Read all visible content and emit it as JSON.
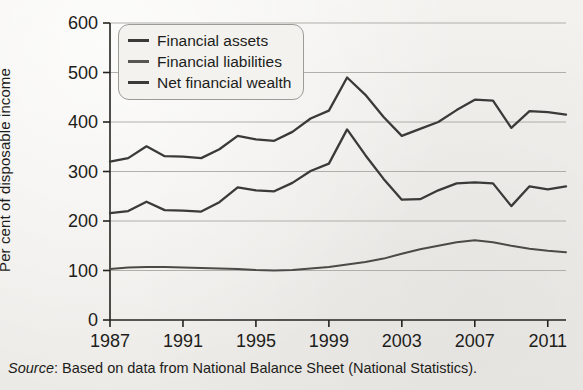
{
  "figure": {
    "y_axis_label": "Per cent of disposable income",
    "source_prefix": "Source",
    "source_text": ": Based on data from National Balance Sheet (National Statistics)."
  },
  "legend": {
    "items": [
      {
        "label": "Financial assets",
        "swatch": "line-swatch-dark"
      },
      {
        "label": "Financial liabilities",
        "swatch": "line-swatch-mid"
      },
      {
        "label": "Net financial wealth",
        "swatch": "line-swatch-dark"
      }
    ]
  },
  "colors": {
    "background": "#f2f1ee",
    "axis": "#24241f",
    "grid": "#a9a7a2",
    "series": "#3a3a38",
    "text": "#1d1d1b"
  },
  "chart_data": {
    "type": "line",
    "title": "",
    "xlabel": "",
    "ylabel": "Per cent of disposable income",
    "xlim": [
      1987,
      2012
    ],
    "ylim": [
      0,
      600
    ],
    "ytick_labels": [
      "0",
      "100",
      "200",
      "300",
      "400",
      "500",
      "600"
    ],
    "yticks": [
      0,
      100,
      200,
      300,
      400,
      500,
      600
    ],
    "xtick_labels": [
      "1987",
      "1991",
      "1995",
      "1999",
      "2003",
      "2007",
      "2011"
    ],
    "xticks": [
      1987,
      1991,
      1995,
      1999,
      2003,
      2007,
      2011
    ],
    "grid": "horizontal",
    "legend_position": "upper-left-inside",
    "x": [
      1987,
      1988,
      1989,
      1990,
      1991,
      1992,
      1993,
      1994,
      1995,
      1996,
      1997,
      1998,
      1999,
      2000,
      2001,
      2002,
      2003,
      2004,
      2005,
      2006,
      2007,
      2008,
      2009,
      2010,
      2011,
      2012
    ],
    "series": [
      {
        "name": "Financial assets",
        "values": [
          320,
          327,
          351,
          331,
          330,
          327,
          345,
          372,
          365,
          362,
          380,
          407,
          423,
          490,
          455,
          410,
          372,
          386,
          400,
          424,
          445,
          443,
          388,
          422,
          420,
          415
        ]
      },
      {
        "name": "Financial liabilities",
        "values": [
          103,
          106,
          107,
          107,
          106,
          105,
          104,
          103,
          101,
          100,
          101,
          104,
          107,
          112,
          117,
          124,
          134,
          143,
          150,
          157,
          161,
          157,
          150,
          144,
          140,
          137
        ]
      },
      {
        "name": "Net financial wealth",
        "values": [
          216,
          220,
          239,
          222,
          221,
          219,
          238,
          268,
          262,
          260,
          277,
          301,
          316,
          385,
          333,
          285,
          243,
          244,
          262,
          276,
          278,
          276,
          230,
          270,
          264,
          270
        ]
      }
    ]
  }
}
